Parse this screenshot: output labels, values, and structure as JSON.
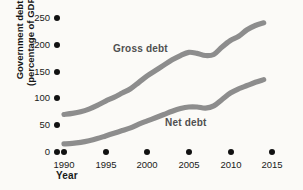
{
  "chart_data": {
    "type": "line",
    "title": "",
    "xlabel": "Year",
    "ylabel_line1": "Government debt",
    "ylabel_line2": "(percentage of GDP)",
    "xlim": [
      1990,
      2015
    ],
    "ylim": [
      0,
      250
    ],
    "grid": false,
    "legend_position": "inline-annotation",
    "xticks": [
      "1990",
      "1995",
      "2000",
      "2005",
      "2010",
      "2015"
    ],
    "xtick_values": [
      1990,
      1995,
      2000,
      2005,
      2010,
      2015
    ],
    "yticks": [
      "0",
      "50",
      "100",
      "150",
      "200",
      "250"
    ],
    "ytick_values": [
      0,
      50,
      100,
      150,
      200,
      250
    ],
    "line_color": "#8d8d8d",
    "background_color": "#fbfaf7",
    "x": [
      1990,
      1991,
      1992,
      1993,
      1994,
      1995,
      1996,
      1997,
      1998,
      1999,
      2000,
      2001,
      2002,
      2003,
      2004,
      2005,
      2006,
      2007,
      2008,
      2009,
      2010,
      2011,
      2012,
      2013,
      2014
    ],
    "series": [
      {
        "name": "Gross debt",
        "label": "Gross debt",
        "values": [
          70,
          72,
          75,
          80,
          87,
          95,
          102,
          110,
          118,
          130,
          142,
          152,
          162,
          172,
          180,
          186,
          184,
          180,
          182,
          196,
          208,
          216,
          228,
          236,
          241
        ]
      },
      {
        "name": "Net debt",
        "label": "Net debt",
        "values": [
          15,
          16,
          18,
          21,
          25,
          30,
          35,
          40,
          45,
          52,
          58,
          64,
          70,
          76,
          81,
          84,
          84,
          82,
          86,
          98,
          110,
          118,
          124,
          130,
          135
        ]
      }
    ]
  }
}
